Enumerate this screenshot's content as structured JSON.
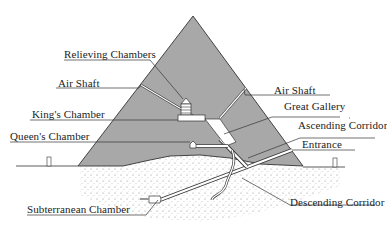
{
  "diagram": {
    "colors": {
      "pyramid_fill": "#a8a8a8",
      "outline": "#333333",
      "passage": "#ffffff",
      "ground_dots": "#888888",
      "text": "#222222"
    },
    "labels": {
      "relieving_chambers": "Relieving Chambers",
      "air_shaft_left": "Air Shaft",
      "air_shaft_right": "Air Shaft",
      "kings_chamber": "King's Chamber",
      "great_gallery": "Great Gallery",
      "queens_chamber": "Queen's Chamber",
      "ascending_corridor": "Ascending Corridor",
      "entrance": "Entrance",
      "subterranean_chamber": "Subterranean Chamber",
      "descending_corridor": "Descending Corridor"
    }
  }
}
